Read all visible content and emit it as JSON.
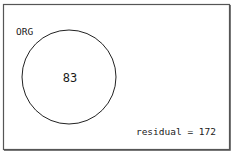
{
  "diagram": {
    "type": "venn",
    "sets": [
      {
        "label": "ORG",
        "count": "83"
      }
    ],
    "residual_label": "residual = 172",
    "colors": {
      "stroke": "#222222",
      "frame": "#555555",
      "background": "#ffffff"
    }
  }
}
